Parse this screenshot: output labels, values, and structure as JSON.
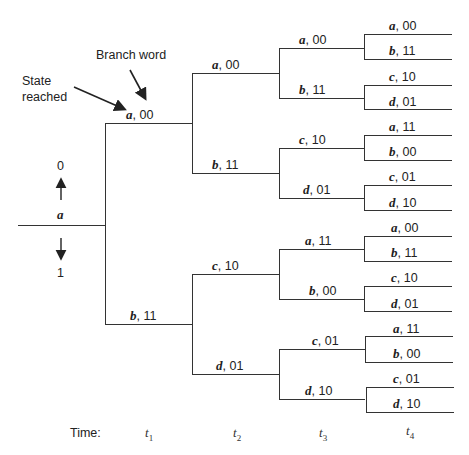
{
  "annotations": {
    "branch_word": "Branch  word",
    "state_reached_line1": "State",
    "state_reached_line2": "reached",
    "input_zero": "0",
    "input_one": "1",
    "root_state": "a"
  },
  "time_axis": {
    "label": "Time:",
    "ticks": [
      {
        "sym": "t",
        "sub": "1"
      },
      {
        "sym": "t",
        "sub": "2"
      },
      {
        "sym": "t",
        "sub": "3"
      },
      {
        "sym": "t",
        "sub": "4"
      }
    ]
  },
  "tree": {
    "t1": [
      {
        "state": "a",
        "word": "00"
      },
      {
        "state": "b",
        "word": "11"
      }
    ],
    "t2": [
      {
        "state": "a",
        "word": "00"
      },
      {
        "state": "b",
        "word": "11"
      },
      {
        "state": "c",
        "word": "10"
      },
      {
        "state": "d",
        "word": "01"
      }
    ],
    "t3": [
      {
        "state": "a",
        "word": "00"
      },
      {
        "state": "b",
        "word": "11"
      },
      {
        "state": "c",
        "word": "10"
      },
      {
        "state": "d",
        "word": "01"
      },
      {
        "state": "a",
        "word": "11"
      },
      {
        "state": "b",
        "word": "00"
      },
      {
        "state": "c",
        "word": "01"
      },
      {
        "state": "d",
        "word": "10"
      }
    ],
    "t4": [
      {
        "state": "a",
        "word": "00"
      },
      {
        "state": "b",
        "word": "11"
      },
      {
        "state": "c",
        "word": "10"
      },
      {
        "state": "d",
        "word": "01"
      },
      {
        "state": "a",
        "word": "11"
      },
      {
        "state": "b",
        "word": "00"
      },
      {
        "state": "c",
        "word": "01"
      },
      {
        "state": "d",
        "word": "10"
      },
      {
        "state": "a",
        "word": "00"
      },
      {
        "state": "b",
        "word": "11"
      },
      {
        "state": "c",
        "word": "10"
      },
      {
        "state": "d",
        "word": "01"
      },
      {
        "state": "a",
        "word": "11"
      },
      {
        "state": "b",
        "word": "00"
      },
      {
        "state": "c",
        "word": "01"
      },
      {
        "state": "d",
        "word": "10"
      }
    ]
  }
}
